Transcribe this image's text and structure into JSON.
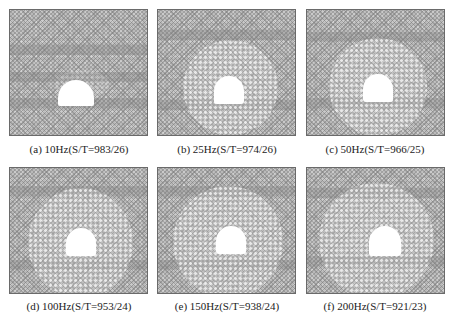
{
  "figure": {
    "panels": [
      {
        "id": "a",
        "caption": "(a)  10Hz(S/T=983/26)",
        "frequency": "10Hz",
        "S": 983,
        "T": 26,
        "loosened_zone": "small"
      },
      {
        "id": "b",
        "caption": "(b)  25Hz(S/T=974/26)",
        "frequency": "25Hz",
        "S": 974,
        "T": 26,
        "loosened_zone": "medium"
      },
      {
        "id": "c",
        "caption": "(c)  50Hz(S/T=966/25)",
        "frequency": "50Hz",
        "S": 966,
        "T": 25,
        "loosened_zone": "medium"
      },
      {
        "id": "d",
        "caption": "(d)  100Hz(S/T=953/24)",
        "frequency": "100Hz",
        "S": 953,
        "T": 24,
        "loosened_zone": "large"
      },
      {
        "id": "e",
        "caption": "(e)  150Hz(S/T=938/24)",
        "frequency": "150Hz",
        "S": 938,
        "T": 24,
        "loosened_zone": "large"
      },
      {
        "id": "f",
        "caption": "(f)  200Hz(S/T=921/23)",
        "frequency": "200Hz",
        "S": 921,
        "T": 23,
        "loosened_zone": "largest"
      }
    ]
  }
}
